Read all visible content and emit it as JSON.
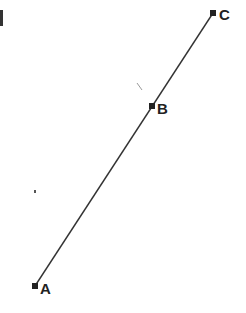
{
  "diagram": {
    "type": "collinear-points",
    "line_color": "#333333",
    "point_color": "#222222",
    "points": [
      {
        "label": "A",
        "x": 35,
        "y": 286
      },
      {
        "label": "B",
        "x": 152,
        "y": 106
      },
      {
        "label": "C",
        "x": 213,
        "y": 13
      }
    ],
    "segment": {
      "from": "A",
      "to": "C"
    }
  }
}
